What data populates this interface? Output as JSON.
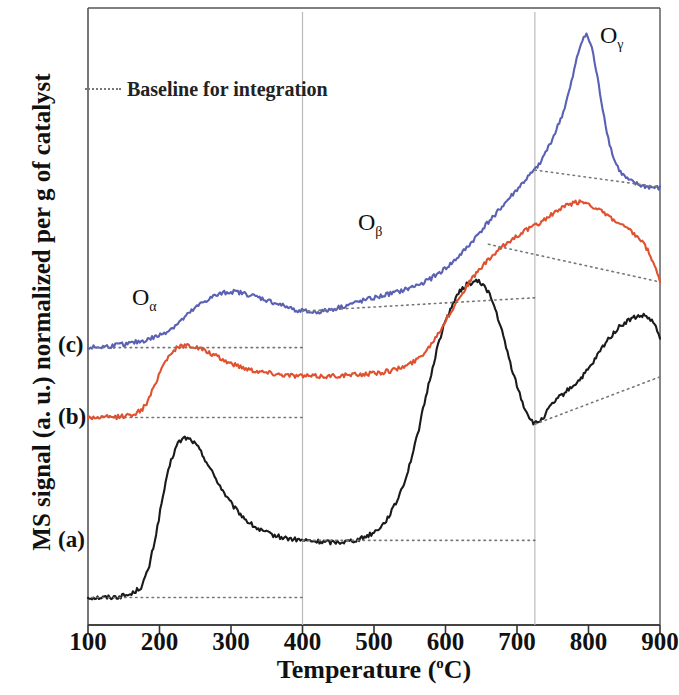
{
  "figure": {
    "ylabel": "MS signal (a. u.) normalized per g of catalyst",
    "xlabel_main": "Temperature (",
    "xlabel_unit": "o",
    "xlabel_close": "C)",
    "xlabel_full": "Temperature (°C)"
  },
  "legend": {
    "baseline_label": "Baseline for integration",
    "baseline_color": "#777777"
  },
  "annotations": [
    {
      "name": "o-alpha",
      "base": "O",
      "sub": "α",
      "x": 132,
      "y": 284
    },
    {
      "name": "o-beta",
      "base": "O",
      "sub": "β",
      "x": 358,
      "y": 209
    },
    {
      "name": "o-gamma",
      "base": "O",
      "sub": "γ",
      "x": 600,
      "y": 22
    }
  ],
  "curve_labels": [
    {
      "name": "curve-label-c",
      "text": "(c)",
      "x": 58,
      "y": 332
    },
    {
      "name": "curve-label-b",
      "text": "(b)",
      "x": 58,
      "y": 404
    },
    {
      "name": "curve-label-a",
      "text": "(a)",
      "x": 58,
      "y": 527
    }
  ],
  "chart_data": {
    "type": "line",
    "title": "",
    "xlabel": "Temperature (°C)",
    "ylabel": "MS signal (a. u.) normalized per g of catalyst",
    "xlim": [
      100,
      900
    ],
    "ylim": [
      0,
      1
    ],
    "xticks": [
      100,
      200,
      300,
      400,
      500,
      600,
      700,
      800,
      900
    ],
    "xtick_labels": [
      "100",
      "200",
      "300",
      "400",
      "500",
      "600",
      "700",
      "800",
      "900"
    ],
    "yticks": [],
    "ytick_labels": [],
    "grid": "vertical gridlines at 400 and 725 degrees C",
    "gridlines_x": [
      400,
      725
    ],
    "legend_position": "top-left",
    "legend_entries": [
      "Baseline for integration"
    ],
    "annotations": [
      "Oα",
      "Oβ",
      "Oγ"
    ],
    "series": [
      {
        "name": "(a)",
        "label": "(a)",
        "color": "#1a1a1a",
        "offset_label": "lowest trace",
        "x": [
          100,
          120,
          140,
          160,
          175,
          185,
          195,
          205,
          215,
          225,
          235,
          245,
          255,
          265,
          275,
          285,
          295,
          305,
          315,
          325,
          340,
          355,
          370,
          385,
          400,
          420,
          440,
          460,
          480,
          500,
          515,
          530,
          545,
          560,
          575,
          590,
          600,
          610,
          620,
          630,
          640,
          645,
          652,
          660,
          670,
          680,
          690,
          700,
          710,
          720,
          725,
          735,
          745,
          755,
          765,
          775,
          785,
          795,
          805,
          815,
          825,
          835,
          845,
          855,
          865,
          875,
          880,
          890,
          900
        ],
        "y": [
          0.037,
          0.037,
          0.038,
          0.042,
          0.055,
          0.085,
          0.14,
          0.205,
          0.258,
          0.29,
          0.3,
          0.296,
          0.282,
          0.262,
          0.24,
          0.22,
          0.2,
          0.184,
          0.172,
          0.16,
          0.148,
          0.141,
          0.136,
          0.133,
          0.131,
          0.129,
          0.128,
          0.129,
          0.133,
          0.144,
          0.16,
          0.19,
          0.235,
          0.3,
          0.38,
          0.455,
          0.492,
          0.52,
          0.54,
          0.552,
          0.556,
          0.557,
          0.552,
          0.54,
          0.51,
          0.47,
          0.425,
          0.385,
          0.35,
          0.328,
          0.322,
          0.33,
          0.348,
          0.362,
          0.372,
          0.382,
          0.392,
          0.405,
          0.42,
          0.44,
          0.458,
          0.472,
          0.484,
          0.492,
          0.498,
          0.5,
          0.5,
          0.49,
          0.466
        ]
      },
      {
        "name": "(b)",
        "label": "(b)",
        "color": "#e0512f",
        "offset_label": "middle trace",
        "x": [
          100,
          120,
          140,
          160,
          175,
          185,
          195,
          205,
          215,
          225,
          235,
          245,
          255,
          265,
          275,
          290,
          305,
          320,
          335,
          350,
          370,
          390,
          410,
          430,
          450,
          470,
          490,
          510,
          530,
          545,
          560,
          575,
          590,
          605,
          620,
          635,
          650,
          665,
          680,
          695,
          710,
          725,
          740,
          755,
          770,
          780,
          790,
          800,
          810,
          820,
          830,
          840,
          850,
          860,
          870,
          880,
          890,
          900
        ],
        "y": [
          0.333,
          0.333,
          0.334,
          0.337,
          0.345,
          0.362,
          0.392,
          0.42,
          0.438,
          0.448,
          0.452,
          0.451,
          0.447,
          0.442,
          0.436,
          0.427,
          0.42,
          0.414,
          0.41,
          0.407,
          0.404,
          0.402,
          0.401,
          0.401,
          0.402,
          0.403,
          0.405,
          0.407,
          0.412,
          0.418,
          0.428,
          0.446,
          0.472,
          0.502,
          0.532,
          0.558,
          0.58,
          0.598,
          0.614,
          0.628,
          0.64,
          0.648,
          0.66,
          0.672,
          0.682,
          0.686,
          0.688,
          0.685,
          0.678,
          0.67,
          0.662,
          0.654,
          0.646,
          0.638,
          0.628,
          0.614,
          0.59,
          0.556
        ]
      },
      {
        "name": "(c)",
        "label": "(c)",
        "color": "#5a60b4",
        "offset_label": "top trace",
        "x": [
          100,
          120,
          140,
          160,
          180,
          200,
          215,
          230,
          245,
          260,
          275,
          290,
          300,
          310,
          325,
          340,
          355,
          370,
          385,
          400,
          415,
          430,
          445,
          460,
          475,
          490,
          505,
          520,
          535,
          550,
          565,
          580,
          595,
          610,
          625,
          640,
          655,
          670,
          685,
          700,
          715,
          725,
          735,
          745,
          755,
          765,
          775,
          785,
          792,
          798,
          805,
          812,
          820,
          828,
          836,
          845,
          855,
          865,
          875,
          885,
          900
        ],
        "y": [
          0.448,
          0.449,
          0.452,
          0.455,
          0.46,
          0.468,
          0.478,
          0.492,
          0.508,
          0.522,
          0.532,
          0.538,
          0.54,
          0.539,
          0.535,
          0.53,
          0.524,
          0.518,
          0.512,
          0.508,
          0.506,
          0.508,
          0.512,
          0.517,
          0.522,
          0.527,
          0.531,
          0.536,
          0.54,
          0.546,
          0.553,
          0.562,
          0.574,
          0.588,
          0.606,
          0.626,
          0.648,
          0.668,
          0.688,
          0.708,
          0.728,
          0.74,
          0.758,
          0.78,
          0.806,
          0.836,
          0.878,
          0.93,
          0.958,
          0.962,
          0.94,
          0.895,
          0.84,
          0.79,
          0.756,
          0.736,
          0.724,
          0.718,
          0.714,
          0.712,
          0.71
        ]
      }
    ],
    "baselines": [
      {
        "name": "baseline-a-low",
        "for_series": "(a)",
        "color": "#777777",
        "style": "dotted",
        "x": [
          105,
          400
        ],
        "y": [
          0.037,
          0.037
        ]
      },
      {
        "name": "baseline-a-mid",
        "for_series": "(a)",
        "color": "#777777",
        "style": "dotted",
        "x": [
          400,
          725
        ],
        "y": [
          0.131,
          0.131
        ]
      },
      {
        "name": "baseline-a-high",
        "for_series": "(a)",
        "color": "#777777",
        "style": "dotted",
        "x": [
          725,
          900
        ],
        "y": [
          0.322,
          0.4
        ]
      },
      {
        "name": "baseline-b-low",
        "for_series": "(b)",
        "color": "#777777",
        "style": "dotted",
        "x": [
          105,
          400
        ],
        "y": [
          0.333,
          0.333
        ]
      },
      {
        "name": "baseline-b-high",
        "for_series": "(b)",
        "color": "#777777",
        "style": "dotted",
        "x": [
          660,
          900
        ],
        "y": [
          0.618,
          0.556
        ]
      },
      {
        "name": "baseline-c-low",
        "for_series": "(c)",
        "color": "#777777",
        "style": "dotted",
        "x": [
          105,
          400
        ],
        "y": [
          0.448,
          0.448
        ]
      },
      {
        "name": "baseline-c-mid",
        "for_series": "(c)",
        "color": "#777777",
        "style": "dotted",
        "x": [
          400,
          725
        ],
        "y": [
          0.508,
          0.53
        ]
      },
      {
        "name": "baseline-c-high",
        "for_series": "(c)",
        "color": "#777777",
        "style": "dotted",
        "x": [
          725,
          900
        ],
        "y": [
          0.74,
          0.712
        ]
      }
    ]
  }
}
